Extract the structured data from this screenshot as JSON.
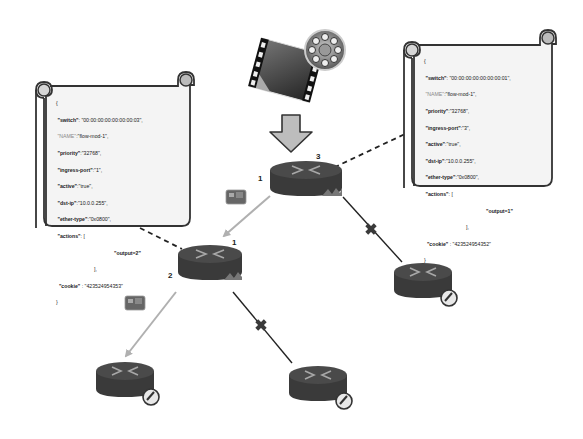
{
  "diagram": {
    "type": "sdn-openflow-topology",
    "source": {
      "icon": "video-film-reel-icon"
    },
    "arrow": {
      "icon": "down-arrow-icon"
    },
    "switches": [
      {
        "id": "top",
        "ports": {
          "in": "3",
          "out": "1"
        }
      },
      {
        "id": "middle",
        "ports": {
          "in": "1",
          "out": "2"
        }
      },
      {
        "id": "right-leaf"
      },
      {
        "id": "bottom-left-leaf"
      },
      {
        "id": "bottom-mid-leaf"
      }
    ],
    "links": [
      {
        "from": "top",
        "to": "middle",
        "style": "flow-arrow-gray",
        "packet_icon": true
      },
      {
        "from": "middle",
        "to": "bottom-left-leaf",
        "style": "flow-arrow-gray",
        "packet_icon": true
      },
      {
        "from": "top",
        "to": "right-leaf",
        "style": "blocked-solid",
        "blocked_marker": "x"
      },
      {
        "from": "middle",
        "to": "bottom-mid-leaf",
        "style": "blocked-solid",
        "blocked_marker": "x"
      }
    ],
    "callouts": {
      "left": {
        "attached_to": "middle",
        "lines": {
          "open": "{",
          "switch_key": "\"switch\"",
          "switch_val": ": \"00:00:00:00:00:00:00:03\",",
          "name_key": "\"NAME\"",
          "name_val": ":\"flow-mod-1\",",
          "priority_key": "\"priority\"",
          "priority_val": ":\"32768\",",
          "ingress_key": "\"ingress-port\"",
          "ingress_val": ":\"1\",",
          "active_key": "\"active\"",
          "active_val": ":\"true\",",
          "dstip_key": "\"dst-ip\"",
          "dstip_val": ":\"10.0.0.255\",",
          "ethertype_key": "\"ether-type\"",
          "ethertype_val": ":\"0x0800\",",
          "actions_key": "\"actions\"",
          "actions_val": ": [",
          "output": "\"output=2\"",
          "close_bracket": "],",
          "cookie_key": "\"cookie\"",
          "cookie_val": " : \"423524954353\"",
          "close": "}"
        }
      },
      "right": {
        "attached_to": "top",
        "lines": {
          "open": "{",
          "switch_key": "\"switch\"",
          "switch_val": ": \"00:00:00:00:00:00:00:01\",",
          "name_key": "\"NAME\"",
          "name_val": ":\"flow-mod-1\",",
          "priority_key": "\"priority\"",
          "priority_val": ":\"32768\",",
          "ingress_key": "\"ingress-port\"",
          "ingress_val": ":\"3\",",
          "active_key": "\"active\"",
          "active_val": ":\"true\",",
          "dstip_key": "\"dst-ip\"",
          "dstip_val": ":\"10.0.0.255\",",
          "ethertype_key": "\"ether-type\"",
          "ethertype_val": ":\"0x0800\",",
          "actions_key": "\"actions\"",
          "actions_val": ": [",
          "output": "\"output=1\"",
          "close_bracket": "],",
          "cookie_key": "\"cookie\"",
          "cookie_val": " : \"423524954352\"",
          "close": "}"
        }
      }
    },
    "colors": {
      "router_body": "#3a3a3a",
      "router_top": "#4a4a4a",
      "router_arrows": "#a8a8a8",
      "flow_arrow": "#b0b0b0",
      "blocked_link": "#222222",
      "blocked_marker": "#3a3a3a",
      "scroll_fill": "#f4f4f4",
      "scroll_stroke": "#333333",
      "big_arrow_fill": "#bdbdbd"
    }
  }
}
